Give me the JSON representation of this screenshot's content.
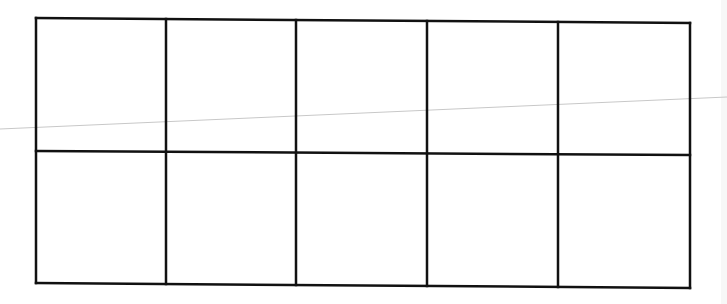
{
  "diagram": {
    "type": "ten-frame",
    "rows": 2,
    "columns": 5,
    "cells": [
      [
        "",
        "",
        "",
        "",
        ""
      ],
      [
        "",
        "",
        "",
        "",
        ""
      ]
    ],
    "line_color": "#111111",
    "line_width": 2.5,
    "background": "#ffffff",
    "frame": {
      "left": 36,
      "right": 690,
      "top_left_y": 18,
      "top_right_y": 23,
      "bottom_left_y": 283,
      "bottom_right_y": 288,
      "mid_left_y": 151,
      "mid_right_y": 155,
      "column_x": [
        36,
        166,
        296,
        427,
        558,
        690
      ]
    },
    "artifact_line": {
      "x1": 0,
      "y1": 129,
      "x2": 727,
      "y2": 97,
      "color": "#c8c8c8"
    }
  }
}
